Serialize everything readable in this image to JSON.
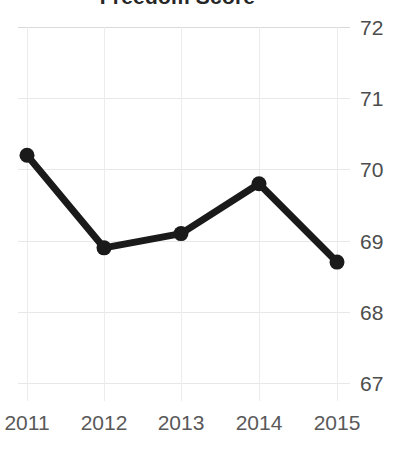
{
  "chart_data": {
    "type": "line",
    "title": "Freedom Score",
    "xlabel": "",
    "ylabel": "",
    "categories": [
      "2011",
      "2012",
      "2013",
      "2014",
      "2015"
    ],
    "x": [
      2011,
      2012,
      2013,
      2014,
      2015
    ],
    "values": [
      70.2,
      68.9,
      69.1,
      69.8,
      68.7
    ],
    "series": [
      {
        "name": "Freedom Score",
        "values": [
          70.2,
          68.9,
          69.1,
          69.8,
          68.7
        ]
      }
    ],
    "ylim": [
      66.75,
      72.0
    ],
    "yticks": [
      72,
      71,
      70,
      69,
      68,
      67
    ],
    "ytick_labels": [
      "72",
      "71",
      "70",
      "69",
      "68",
      "67"
    ],
    "xtick_labels": [
      "2011",
      "2012",
      "2013",
      "2014",
      "2015"
    ],
    "grid": true,
    "grid_axis": "both",
    "legend": false,
    "legend_position": "none",
    "y_axis_position": "right",
    "marker": "circle",
    "line_color": "#1a1a1a",
    "marker_color": "#1a1a1a",
    "grid_color": "#e8e8e8",
    "tick_label_color": "#595959",
    "title_color": "#262626",
    "background_color": "#ffffff",
    "annotations": []
  }
}
